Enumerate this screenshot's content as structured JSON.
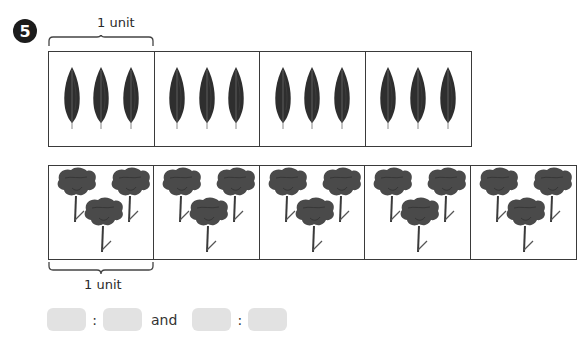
{
  "question": {
    "number": "5",
    "top_label": "1 unit",
    "bottom_label": "1 unit"
  },
  "leaf_row": {
    "item": "leaf",
    "icon": "leaf-icon",
    "groups": 4,
    "items_per_group": 3,
    "color": "#2e2e2e"
  },
  "flower_row": {
    "item": "flower",
    "icon": "flower-icon",
    "groups": 5,
    "items_per_group": 3,
    "color": "#4a4a4a"
  },
  "answer": {
    "separator": ":",
    "conjunction": "and",
    "boxes": [
      "",
      "",
      "",
      ""
    ],
    "box_color": "#e2e2e2"
  }
}
